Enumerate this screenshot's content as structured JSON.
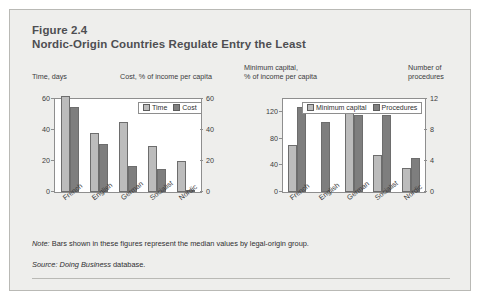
{
  "figure": {
    "label": "Figure 2.4",
    "title": "Nordic-Origin Countries Regulate Entry the Least"
  },
  "captions": {
    "time": "Time, days",
    "cost": "Cost, % of income per capita",
    "min_capital_line1": "Minimum capital,",
    "min_capital_line2": "% of income per capita",
    "procedures_line1": "Number of",
    "procedures_line2": "procedures"
  },
  "footer": {
    "note_label": "Note:",
    "note_text": " Bars shown in these figures represent the median values by legal-origin group.",
    "source_label": "Source:",
    "source_italic": " Doing Business",
    "source_text": " database."
  },
  "colors": {
    "panel_background": "#eeeeec",
    "panel_border": "#b9b9b5",
    "plot_background": "#ffffff",
    "axis": "#8e8e8e",
    "series_light": "#bcbcbc",
    "series_dark": "#7e7e7e",
    "title_text": "#4e4e52",
    "body_text": "#3b3b3d"
  },
  "chart_data": [
    {
      "id": "entry-time-cost",
      "type": "bar",
      "title": "",
      "categories": [
        "French",
        "English",
        "German",
        "Socialist",
        "Nordic"
      ],
      "series": [
        {
          "name": "Time",
          "values": [
            62,
            38,
            45,
            30,
            20
          ],
          "axis": "left",
          "color": "#bcbcbc"
        },
        {
          "name": "Cost",
          "values": [
            55,
            31,
            17,
            15,
            1
          ],
          "axis": "right",
          "color": "#7e7e7e"
        }
      ],
      "xlabel": "",
      "ylabel": "Time, days",
      "y2label": "Cost, % of income per capita",
      "ylim": [
        0,
        60
      ],
      "y2lim": [
        0,
        60
      ],
      "yticks": [
        0,
        20,
        40,
        60
      ],
      "y2ticks": [
        0,
        20,
        40,
        60
      ],
      "grid": false,
      "legend": [
        "Time",
        "Cost"
      ],
      "legend_position": "top-right"
    },
    {
      "id": "entry-mincapital-procedures",
      "type": "bar",
      "title": "",
      "categories": [
        "French",
        "English",
        "German",
        "Socialist",
        "Nordic"
      ],
      "series": [
        {
          "name": "Minimum capital",
          "values": [
            71,
            0,
            121,
            55,
            36
          ],
          "axis": "left",
          "color": "#bcbcbc"
        },
        {
          "name": "Procedures",
          "values": [
            11.0,
            9.0,
            10.0,
            10.0,
            4.4
          ],
          "axis": "right",
          "color": "#7e7e7e"
        }
      ],
      "xlabel": "",
      "ylabel": "Minimum capital, % of income per capita",
      "y2label": "Number of procedures",
      "ylim": [
        0,
        140
      ],
      "y2lim": [
        0,
        12
      ],
      "yticks": [
        0,
        40,
        80,
        120
      ],
      "y2ticks": [
        0,
        4,
        8,
        12
      ],
      "grid": false,
      "legend": [
        "Minimum capital",
        "Procedures"
      ],
      "legend_position": "top-right"
    }
  ]
}
